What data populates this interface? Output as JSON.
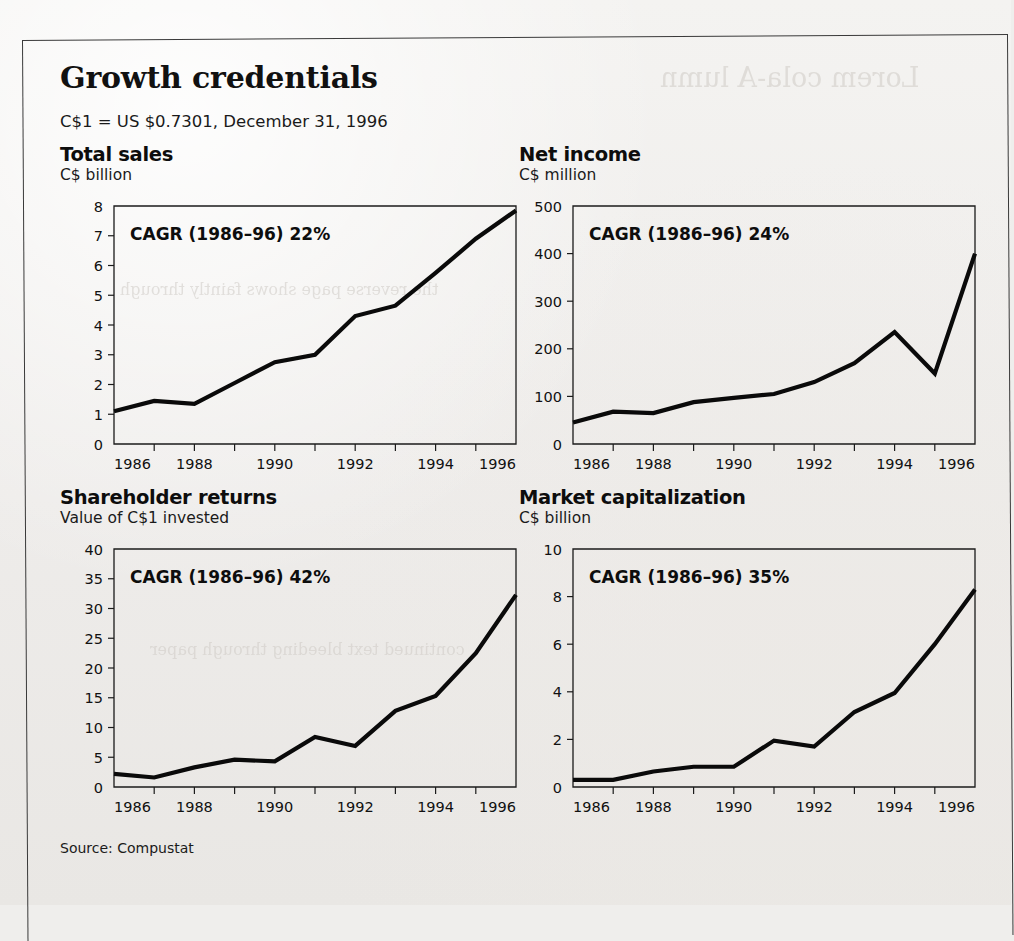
{
  "page": {
    "title": "Growth credentials",
    "fx_note": "C$1 = US $0.7301, December 31, 1996",
    "source": "Source: Compustat"
  },
  "charts": [
    {
      "id": "total-sales",
      "title": "Total sales",
      "subtitle": "C$ billion",
      "cagr_label": "CAGR (1986–96) 22%"
    },
    {
      "id": "net-income",
      "title": "Net income",
      "subtitle": "C$ million",
      "cagr_label": "CAGR (1986–96) 24%"
    },
    {
      "id": "shareholder-returns",
      "title": "Shareholder returns",
      "subtitle": "Value of C$1 invested",
      "cagr_label": "CAGR (1986–96) 42%"
    },
    {
      "id": "market-capitalization",
      "title": "Market capitalization",
      "subtitle": "C$ billion",
      "cagr_label": "CAGR (1986–96) 35%"
    }
  ],
  "chart_data": [
    {
      "type": "line",
      "id": "total-sales",
      "title": "Total sales",
      "subtitle": "C$ billion",
      "xlabel": "",
      "ylabel": "C$ billion",
      "annotation": "CAGR (1986–96) 22%",
      "x": [
        1986,
        1987,
        1988,
        1989,
        1990,
        1991,
        1992,
        1993,
        1994,
        1995,
        1996
      ],
      "values": [
        1.1,
        1.45,
        1.35,
        2.05,
        2.75,
        3.0,
        4.3,
        4.65,
        5.75,
        6.9,
        7.85
      ],
      "xticks": [
        1986,
        1987,
        1988,
        1989,
        1990,
        1991,
        1992,
        1993,
        1994,
        1995,
        1996
      ],
      "xtick_labels": [
        "1986",
        "",
        "1988",
        "",
        "1990",
        "",
        "1992",
        "",
        "1994",
        "",
        "1996"
      ],
      "yticks": [
        0,
        1,
        2,
        3,
        4,
        5,
        6,
        7,
        8
      ],
      "ytick_labels": [
        "0",
        "1",
        "2",
        "3",
        "4",
        "5",
        "6",
        "7",
        "8"
      ],
      "xlim": [
        1986,
        1996
      ],
      "ylim": [
        0,
        8
      ],
      "grid": false,
      "legend": "none"
    },
    {
      "type": "line",
      "id": "net-income",
      "title": "Net income",
      "subtitle": "C$ million",
      "xlabel": "",
      "ylabel": "C$ million",
      "annotation": "CAGR (1986–96) 24%",
      "x": [
        1986,
        1987,
        1988,
        1989,
        1990,
        1991,
        1992,
        1993,
        1994,
        1995,
        1996
      ],
      "values": [
        45,
        68,
        65,
        88,
        97,
        105,
        130,
        170,
        235,
        148,
        400
      ],
      "xticks": [
        1986,
        1987,
        1988,
        1989,
        1990,
        1991,
        1992,
        1993,
        1994,
        1995,
        1996
      ],
      "xtick_labels": [
        "1986",
        "",
        "1988",
        "",
        "1990",
        "",
        "1992",
        "",
        "1994",
        "",
        "1996"
      ],
      "yticks": [
        0,
        100,
        200,
        300,
        400,
        500
      ],
      "ytick_labels": [
        "0",
        "100",
        "200",
        "300",
        "400",
        "500"
      ],
      "xlim": [
        1986,
        1996
      ],
      "ylim": [
        0,
        500
      ],
      "grid": false,
      "legend": "none"
    },
    {
      "type": "line",
      "id": "shareholder-returns",
      "title": "Shareholder returns",
      "subtitle": "Value of C$1 invested",
      "xlabel": "",
      "ylabel": "Value of C$1 invested",
      "annotation": "CAGR (1986–96) 42%",
      "x": [
        1986,
        1987,
        1988,
        1989,
        1990,
        1991,
        1992,
        1993,
        1994,
        1995,
        1996
      ],
      "values": [
        2.2,
        1.6,
        3.3,
        4.6,
        4.3,
        8.4,
        6.9,
        12.8,
        15.3,
        22.5,
        32.3
      ],
      "xticks": [
        1986,
        1987,
        1988,
        1989,
        1990,
        1991,
        1992,
        1993,
        1994,
        1995,
        1996
      ],
      "xtick_labels": [
        "1986",
        "",
        "1988",
        "",
        "1990",
        "",
        "1992",
        "",
        "1994",
        "",
        "1996"
      ],
      "yticks": [
        0,
        5,
        10,
        15,
        20,
        25,
        30,
        35,
        40
      ],
      "ytick_labels": [
        "0",
        "5",
        "10",
        "15",
        "20",
        "25",
        "30",
        "35",
        "40"
      ],
      "xlim": [
        1986,
        1996
      ],
      "ylim": [
        0,
        40
      ],
      "grid": false,
      "legend": "none"
    },
    {
      "type": "line",
      "id": "market-capitalization",
      "title": "Market capitalization",
      "subtitle": "C$ billion",
      "xlabel": "",
      "ylabel": "C$ billion",
      "annotation": "CAGR (1986–96) 35%",
      "x": [
        1986,
        1987,
        1988,
        1989,
        1990,
        1991,
        1992,
        1993,
        1994,
        1995,
        1996
      ],
      "values": [
        0.3,
        0.3,
        0.65,
        0.85,
        0.85,
        1.95,
        1.7,
        3.15,
        3.95,
        6.0,
        8.3
      ],
      "xticks": [
        1986,
        1987,
        1988,
        1989,
        1990,
        1991,
        1992,
        1993,
        1994,
        1995,
        1996
      ],
      "xtick_labels": [
        "1986",
        "",
        "1988",
        "",
        "1990",
        "",
        "1992",
        "",
        "1994",
        "",
        "1996"
      ],
      "yticks": [
        0,
        2,
        4,
        6,
        8,
        10
      ],
      "ytick_labels": [
        "0",
        "2",
        "4",
        "6",
        "8",
        "10"
      ],
      "xlim": [
        1986,
        1996
      ],
      "ylim": [
        0,
        10
      ],
      "grid": false,
      "legend": "none"
    }
  ],
  "colors": {
    "ink": "#0a0a0a",
    "paper": "#efeeec",
    "axis": "#1b1b1b"
  }
}
